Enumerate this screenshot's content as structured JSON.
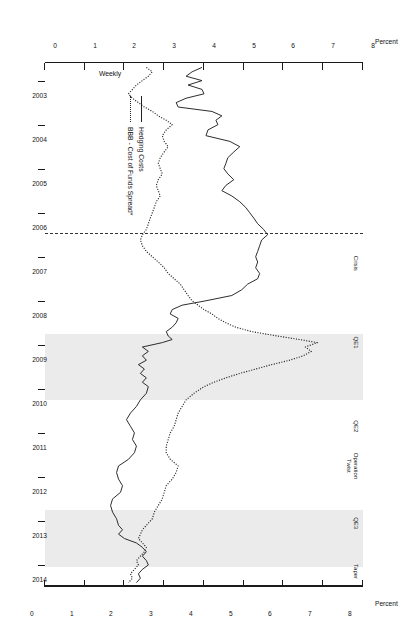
{
  "chart_data": {
    "type": "line",
    "title": "",
    "frequency_label": "Weekly",
    "xlabel": "",
    "ylabel": "Percent",
    "ylabel_right": "Percent",
    "ylim": [
      0,
      8
    ],
    "yticks": [
      0,
      1,
      2,
      3,
      4,
      5,
      6,
      7,
      8
    ],
    "ytick_labels": [
      "0",
      "1",
      "2",
      "3",
      "4",
      "5",
      "6",
      "7",
      "8"
    ],
    "xlim": [
      2002.6,
      2014.5
    ],
    "xticks": [
      2003,
      2004,
      2005,
      2006,
      2007,
      2008,
      2009,
      2010,
      2011,
      2012,
      2013,
      2014
    ],
    "xtick_labels": [
      "2003",
      "2004",
      "2005",
      "2006",
      "2007",
      "2008",
      "2009",
      "2010",
      "2011",
      "2012",
      "2013",
      "2014"
    ],
    "grid": false,
    "legend_position": "bottom-left",
    "series": [
      {
        "name": "Hedging Costs",
        "style": "solid",
        "color": "#222222",
        "points": [
          [
            2002.7,
            3.95
          ],
          [
            2002.8,
            3.7
          ],
          [
            2002.9,
            3.55
          ],
          [
            2003.0,
            3.95
          ],
          [
            2003.1,
            3.6
          ],
          [
            2003.2,
            3.95
          ],
          [
            2003.3,
            4.0
          ],
          [
            2003.4,
            3.55
          ],
          [
            2003.5,
            3.3
          ],
          [
            2003.6,
            3.35
          ],
          [
            2003.7,
            4.2
          ],
          [
            2003.8,
            4.45
          ],
          [
            2003.9,
            4.3
          ],
          [
            2004.0,
            4.35
          ],
          [
            2004.12,
            4.1
          ],
          [
            2004.25,
            4.05
          ],
          [
            2004.38,
            4.65
          ],
          [
            2004.5,
            4.9
          ],
          [
            2004.62,
            4.75
          ],
          [
            2004.75,
            4.6
          ],
          [
            2004.88,
            4.55
          ],
          [
            2005.0,
            4.5
          ],
          [
            2005.12,
            4.6
          ],
          [
            2005.25,
            4.75
          ],
          [
            2005.38,
            4.55
          ],
          [
            2005.5,
            4.45
          ],
          [
            2005.62,
            4.7
          ],
          [
            2005.75,
            4.9
          ],
          [
            2005.88,
            5.05
          ],
          [
            2006.0,
            5.15
          ],
          [
            2006.12,
            5.25
          ],
          [
            2006.25,
            5.35
          ],
          [
            2006.38,
            5.5
          ],
          [
            2006.5,
            5.6
          ],
          [
            2006.62,
            5.45
          ],
          [
            2006.75,
            5.4
          ],
          [
            2006.88,
            5.35
          ],
          [
            2007.0,
            5.3
          ],
          [
            2007.12,
            5.35
          ],
          [
            2007.25,
            5.3
          ],
          [
            2007.38,
            5.4
          ],
          [
            2007.5,
            5.35
          ],
          [
            2007.62,
            5.1
          ],
          [
            2007.75,
            4.95
          ],
          [
            2007.88,
            4.7
          ],
          [
            2008.0,
            4.05
          ],
          [
            2008.1,
            3.45
          ],
          [
            2008.2,
            3.2
          ],
          [
            2008.3,
            3.15
          ],
          [
            2008.4,
            3.35
          ],
          [
            2008.5,
            3.3
          ],
          [
            2008.6,
            3.2
          ],
          [
            2008.7,
            3.05
          ],
          [
            2008.8,
            3.1
          ],
          [
            2008.88,
            3.2
          ],
          [
            2008.95,
            2.95
          ],
          [
            2009.05,
            2.45
          ],
          [
            2009.15,
            2.6
          ],
          [
            2009.25,
            2.45
          ],
          [
            2009.35,
            2.55
          ],
          [
            2009.45,
            2.35
          ],
          [
            2009.55,
            2.5
          ],
          [
            2009.65,
            2.4
          ],
          [
            2009.75,
            2.55
          ],
          [
            2009.85,
            2.45
          ],
          [
            2009.95,
            2.6
          ],
          [
            2010.1,
            2.55
          ],
          [
            2010.25,
            2.4
          ],
          [
            2010.4,
            2.3
          ],
          [
            2010.55,
            2.15
          ],
          [
            2010.7,
            2.05
          ],
          [
            2010.85,
            2.15
          ],
          [
            2011.0,
            2.25
          ],
          [
            2011.15,
            2.2
          ],
          [
            2011.3,
            2.3
          ],
          [
            2011.45,
            2.25
          ],
          [
            2011.6,
            2.1
          ],
          [
            2011.75,
            1.85
          ],
          [
            2011.9,
            1.8
          ],
          [
            2012.05,
            1.85
          ],
          [
            2012.2,
            1.95
          ],
          [
            2012.35,
            1.9
          ],
          [
            2012.5,
            1.7
          ],
          [
            2012.65,
            1.65
          ],
          [
            2012.8,
            1.7
          ],
          [
            2012.95,
            1.8
          ],
          [
            2013.1,
            1.85
          ],
          [
            2013.2,
            1.95
          ],
          [
            2013.3,
            1.85
          ],
          [
            2013.4,
            2.0
          ],
          [
            2013.5,
            2.3
          ],
          [
            2013.6,
            2.45
          ],
          [
            2013.7,
            2.55
          ],
          [
            2013.8,
            2.45
          ],
          [
            2013.9,
            2.55
          ],
          [
            2014.0,
            2.6
          ],
          [
            2014.1,
            2.45
          ],
          [
            2014.2,
            2.35
          ],
          [
            2014.3,
            2.4
          ],
          [
            2014.4,
            2.3
          ]
        ]
      },
      {
        "name": "BBB - Cost of Funds Spread*",
        "style": "dotted",
        "color": "#222222",
        "points": [
          [
            2002.7,
            2.55
          ],
          [
            2002.8,
            2.7
          ],
          [
            2002.9,
            2.6
          ],
          [
            2003.0,
            2.45
          ],
          [
            2003.1,
            2.3
          ],
          [
            2003.2,
            2.2
          ],
          [
            2003.3,
            2.1
          ],
          [
            2003.4,
            2.2
          ],
          [
            2003.5,
            2.35
          ],
          [
            2003.6,
            2.5
          ],
          [
            2003.7,
            2.7
          ],
          [
            2003.8,
            2.85
          ],
          [
            2003.9,
            3.05
          ],
          [
            2004.0,
            3.2
          ],
          [
            2004.12,
            3.05
          ],
          [
            2004.25,
            2.95
          ],
          [
            2004.38,
            3.0
          ],
          [
            2004.5,
            3.1
          ],
          [
            2004.62,
            3.0
          ],
          [
            2004.75,
            2.9
          ],
          [
            2004.88,
            2.85
          ],
          [
            2005.0,
            2.9
          ],
          [
            2005.12,
            2.95
          ],
          [
            2005.25,
            2.85
          ],
          [
            2005.38,
            2.8
          ],
          [
            2005.5,
            2.85
          ],
          [
            2005.62,
            2.9
          ],
          [
            2005.75,
            2.8
          ],
          [
            2005.88,
            2.75
          ],
          [
            2006.0,
            2.7
          ],
          [
            2006.12,
            2.65
          ],
          [
            2006.25,
            2.6
          ],
          [
            2006.38,
            2.55
          ],
          [
            2006.5,
            2.45
          ],
          [
            2006.62,
            2.4
          ],
          [
            2006.75,
            2.45
          ],
          [
            2006.88,
            2.55
          ],
          [
            2007.0,
            2.7
          ],
          [
            2007.12,
            2.85
          ],
          [
            2007.25,
            3.0
          ],
          [
            2007.38,
            3.1
          ],
          [
            2007.5,
            3.25
          ],
          [
            2007.62,
            3.4
          ],
          [
            2007.75,
            3.5
          ],
          [
            2007.88,
            3.6
          ],
          [
            2008.0,
            3.7
          ],
          [
            2008.1,
            3.85
          ],
          [
            2008.2,
            4.0
          ],
          [
            2008.3,
            4.2
          ],
          [
            2008.4,
            4.35
          ],
          [
            2008.5,
            4.55
          ],
          [
            2008.6,
            4.8
          ],
          [
            2008.7,
            5.2
          ],
          [
            2008.8,
            5.85
          ],
          [
            2008.88,
            6.4
          ],
          [
            2008.95,
            6.85
          ],
          [
            2009.05,
            6.55
          ],
          [
            2009.15,
            6.7
          ],
          [
            2009.25,
            6.5
          ],
          [
            2009.35,
            6.15
          ],
          [
            2009.45,
            5.7
          ],
          [
            2009.55,
            5.3
          ],
          [
            2009.65,
            4.9
          ],
          [
            2009.75,
            4.55
          ],
          [
            2009.85,
            4.25
          ],
          [
            2009.95,
            4.0
          ],
          [
            2010.1,
            3.75
          ],
          [
            2010.25,
            3.55
          ],
          [
            2010.4,
            3.45
          ],
          [
            2010.55,
            3.35
          ],
          [
            2010.7,
            3.3
          ],
          [
            2010.85,
            3.25
          ],
          [
            2011.0,
            3.15
          ],
          [
            2011.15,
            3.1
          ],
          [
            2011.3,
            3.05
          ],
          [
            2011.45,
            3.05
          ],
          [
            2011.6,
            3.15
          ],
          [
            2011.75,
            3.35
          ],
          [
            2011.9,
            3.3
          ],
          [
            2012.05,
            3.2
          ],
          [
            2012.2,
            3.05
          ],
          [
            2012.35,
            3.0
          ],
          [
            2012.5,
            2.95
          ],
          [
            2012.65,
            2.85
          ],
          [
            2012.8,
            2.75
          ],
          [
            2012.95,
            2.7
          ],
          [
            2013.1,
            2.55
          ],
          [
            2013.2,
            2.45
          ],
          [
            2013.3,
            2.4
          ],
          [
            2013.4,
            2.35
          ],
          [
            2013.5,
            2.45
          ],
          [
            2013.6,
            2.55
          ],
          [
            2013.7,
            2.5
          ],
          [
            2013.8,
            2.4
          ],
          [
            2013.9,
            2.3
          ],
          [
            2014.0,
            2.35
          ],
          [
            2014.1,
            2.25
          ],
          [
            2014.2,
            2.15
          ],
          [
            2014.3,
            2.2
          ],
          [
            2014.4,
            2.1
          ]
        ]
      }
    ],
    "shaded_regions": [
      {
        "label": "QE1",
        "start": 2008.75,
        "end": 2010.25
      },
      {
        "label": "QE3",
        "start": 2012.75,
        "end": 2014.05
      }
    ],
    "annotations": [
      {
        "label": "Crisis",
        "x": 2007.15
      },
      {
        "label": "QE1",
        "x": 2008.95
      },
      {
        "label": "QE2",
        "x": 2010.85
      },
      {
        "label": "Operation\nTwist",
        "x": 2011.75
      },
      {
        "label": "QE3",
        "x": 2013.05
      },
      {
        "label": "Taper",
        "x": 2014.15
      }
    ],
    "vertical_lines": [
      {
        "x": 2006.45,
        "style": "dashed"
      }
    ]
  }
}
